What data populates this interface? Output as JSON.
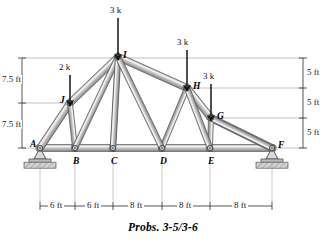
{
  "figure": {
    "caption": "Probs. 3-5/3-6",
    "type": "plane-truss-diagram"
  },
  "joints": [
    {
      "id": "A",
      "label": "A",
      "x": 40,
      "y": 148,
      "support": "pin"
    },
    {
      "id": "B",
      "label": "B",
      "x": 75,
      "y": 148,
      "support": "none"
    },
    {
      "id": "C",
      "label": "C",
      "x": 113,
      "y": 148,
      "support": "none"
    },
    {
      "id": "D",
      "label": "D",
      "x": 162,
      "y": 148,
      "support": "none"
    },
    {
      "id": "E",
      "label": "E",
      "x": 210,
      "y": 148,
      "support": "none"
    },
    {
      "id": "F",
      "label": "F",
      "x": 272,
      "y": 148,
      "support": "roller"
    },
    {
      "id": "G",
      "label": "G",
      "x": 211,
      "y": 118,
      "support": "none"
    },
    {
      "id": "H",
      "label": "H",
      "x": 187,
      "y": 88,
      "support": "none"
    },
    {
      "id": "I",
      "label": "I",
      "x": 118,
      "y": 57,
      "support": "none"
    },
    {
      "id": "J",
      "label": "J",
      "x": 70,
      "y": 103,
      "support": "none"
    }
  ],
  "joint_label_offsets": {
    "A": [
      -10,
      -3
    ],
    "B": [
      -2,
      14
    ],
    "C": [
      -2,
      14
    ],
    "D": [
      -2,
      14
    ],
    "E": [
      -2,
      14
    ],
    "F": [
      6,
      -2
    ],
    "G": [
      6,
      -1
    ],
    "H": [
      6,
      -1
    ],
    "I": [
      5,
      -1
    ],
    "J": [
      -10,
      -2
    ]
  },
  "members": [
    {
      "from": "A",
      "to": "B",
      "chord": "bottom"
    },
    {
      "from": "B",
      "to": "C",
      "chord": "bottom"
    },
    {
      "from": "C",
      "to": "D",
      "chord": "bottom"
    },
    {
      "from": "D",
      "to": "E",
      "chord": "bottom"
    },
    {
      "from": "E",
      "to": "F",
      "chord": "bottom"
    },
    {
      "from": "A",
      "to": "J",
      "chord": "top-left"
    },
    {
      "from": "J",
      "to": "I",
      "chord": "top-left"
    },
    {
      "from": "I",
      "to": "H",
      "chord": "top-right"
    },
    {
      "from": "H",
      "to": "G",
      "chord": "top-right"
    },
    {
      "from": "G",
      "to": "F",
      "chord": "top-right"
    },
    {
      "from": "J",
      "to": "B",
      "chord": "web-vertical"
    },
    {
      "from": "I",
      "to": "C",
      "chord": "web-vertical"
    },
    {
      "from": "H",
      "to": "D",
      "chord": "web-vertical"
    },
    {
      "from": "G",
      "to": "E",
      "chord": "web-vertical"
    },
    {
      "from": "B",
      "to": "I",
      "chord": "web-diagonal"
    },
    {
      "from": "C",
      "to": "I",
      "chord": "web-diagonal"
    },
    {
      "from": "D",
      "to": "I",
      "chord": "web-diagonal"
    },
    {
      "from": "E",
      "to": "H",
      "chord": "web-diagonal"
    },
    {
      "from": "F",
      "to": "G",
      "chord": "web-diagonal"
    }
  ],
  "loads": [
    {
      "label": "3 k",
      "magnitude": 3,
      "unit": "k",
      "at_joint": "I",
      "arrow_x": 118,
      "tail_y": 18,
      "head_y": 55,
      "label_x": 110,
      "label_y": 6
    },
    {
      "label": "2 k",
      "magnitude": 2,
      "unit": "k",
      "at_joint": "J",
      "arrow_x": 70,
      "tail_y": 75,
      "head_y": 101,
      "label_x": 59,
      "label_y": 63
    },
    {
      "label": "3 k",
      "magnitude": 3,
      "unit": "k",
      "at_joint": "H",
      "arrow_x": 187,
      "tail_y": 50,
      "head_y": 86,
      "label_x": 177,
      "label_y": 38
    },
    {
      "label": "3 k",
      "magnitude": 3,
      "unit": "k",
      "at_joint": "G",
      "arrow_x": 211,
      "tail_y": 84,
      "head_y": 116,
      "label_x": 203,
      "label_y": 72
    }
  ],
  "dimensions": {
    "horizontal": {
      "y_line": 206,
      "ticks": [
        40,
        75,
        113,
        162,
        210,
        272
      ],
      "segments": [
        {
          "label": "6 ft",
          "from_x": 40,
          "to_x": 75,
          "center_x": 57
        },
        {
          "label": "6 ft",
          "from_x": 75,
          "to_x": 113,
          "center_x": 94
        },
        {
          "label": "8 ft",
          "from_x": 113,
          "to_x": 162,
          "center_x": 137
        },
        {
          "label": "8 ft",
          "from_x": 162,
          "to_x": 210,
          "center_x": 186
        },
        {
          "label": "8 ft",
          "from_x": 210,
          "to_x": 272,
          "center_x": 241
        }
      ]
    },
    "left_vertical": {
      "x_line": 22,
      "ticks": [
        58,
        103,
        148
      ],
      "segments": [
        {
          "label": "7.5 ft",
          "from_y": 58,
          "to_y": 103,
          "center_y": 80
        },
        {
          "label": "7.5 ft",
          "from_y": 103,
          "to_y": 148,
          "center_y": 125
        }
      ]
    },
    "right_vertical": {
      "x_line": 303,
      "ticks": [
        58,
        88,
        118,
        148
      ],
      "segments": [
        {
          "label": "5 ft",
          "from_y": 58,
          "to_y": 88,
          "center_y": 73
        },
        {
          "label": "5 ft",
          "from_y": 88,
          "to_y": 118,
          "center_y": 103
        },
        {
          "label": "5 ft",
          "from_y": 118,
          "to_y": 148,
          "center_y": 133
        }
      ]
    },
    "extension_lines": [
      {
        "x1": 22,
        "y1": 58,
        "x2": 303,
        "y2": 58
      },
      {
        "x1": 22,
        "y1": 103,
        "x2": 70,
        "y2": 103
      },
      {
        "x1": 187,
        "y1": 88,
        "x2": 303,
        "y2": 88
      },
      {
        "x1": 211,
        "y1": 118,
        "x2": 303,
        "y2": 118
      },
      {
        "x1": 22,
        "y1": 148,
        "x2": 40,
        "y2": 148
      },
      {
        "x1": 272,
        "y1": 148,
        "x2": 303,
        "y2": 148
      }
    ]
  },
  "colors": {
    "member_fill": "#b9b9b9",
    "member_edge": "#4a4a4a",
    "member_highlight": "#e6e6e6",
    "support_fill": "#c9c9c9",
    "support_edge": "#555555",
    "dimension_line": "#333333",
    "extension_line": "#9a9a9a",
    "arrow": "#1a1a1a",
    "background": "#ffffff"
  }
}
